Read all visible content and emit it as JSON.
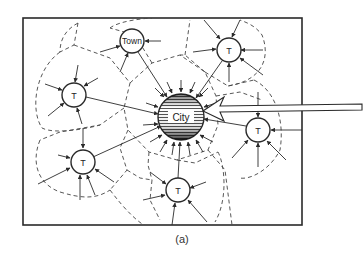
{
  "figure": {
    "caption": "(a)",
    "colors": {
      "ink": "#2a2a2a",
      "boundary": "#444444",
      "background": "#ffffff",
      "city_fill": "#6a6a6a"
    }
  },
  "nodes": [
    {
      "id": "city",
      "label": "City",
      "type": "city",
      "cx": 181,
      "cy": 117,
      "r": 23
    },
    {
      "id": "town",
      "label": "Town",
      "type": "town",
      "cx": 132,
      "cy": 41,
      "r": 12
    },
    {
      "id": "t-upper-right",
      "label": "T",
      "type": "town",
      "cx": 229,
      "cy": 50,
      "r": 12
    },
    {
      "id": "t-left",
      "label": "T",
      "type": "town",
      "cx": 74,
      "cy": 95,
      "r": 12
    },
    {
      "id": "t-right",
      "label": "T",
      "type": "town",
      "cx": 258,
      "cy": 130,
      "r": 12
    },
    {
      "id": "t-lower-left",
      "label": "T",
      "type": "town",
      "cx": 83,
      "cy": 162,
      "r": 12
    },
    {
      "id": "t-bottom",
      "label": "T",
      "type": "town",
      "cx": 178,
      "cy": 190,
      "r": 12
    }
  ],
  "legend": {
    "big_arrow": "external inflow to City",
    "solid_arrows": "flows toward centres",
    "dashed_lines": "market area boundaries"
  }
}
